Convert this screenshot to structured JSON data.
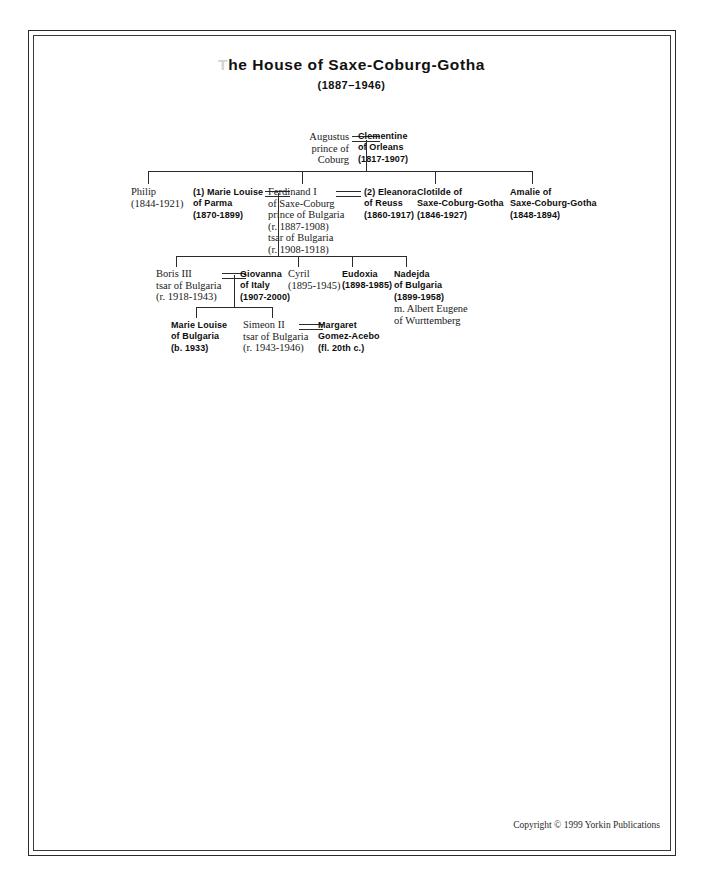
{
  "document": {
    "title_prefix": "T",
    "title_rest": "he House of Saxe-Coburg-Gotha",
    "subtitle": "(1887–1946)",
    "copyright": "Copyright © 1999 Yorkin Publications"
  },
  "generation1": {
    "augustus": {
      "line1": "Augustus",
      "line2": "prince of",
      "line3": "Coburg"
    },
    "clementine": {
      "line1": "Clementine",
      "line2": "of Orleans",
      "line3": "(1817-1907)"
    }
  },
  "generation2": {
    "philip": {
      "line1": "Philip",
      "line2": "(1844-1921)"
    },
    "marie_louise_parma": {
      "line1": "(1) Marie Louise",
      "line2": "of Parma",
      "line3": "(1870-1899)"
    },
    "ferdinand": {
      "line1": "Ferdinand I",
      "line2": "of Saxe-Coburg",
      "line3": "prince of Bulgaria",
      "line4": "(r. 1887-1908)",
      "line5": "tsar of Bulgaria",
      "line6": "(r. 1908-1918)"
    },
    "eleanora_reuss": {
      "line1": "(2) Eleanora",
      "line2": "of Reuss",
      "line3": "(1860-1917)"
    },
    "clotilde": {
      "line1": "Clotilde of",
      "line2": "Saxe-Coburg-Gotha",
      "line3": "(1846-1927)"
    },
    "amalie": {
      "line1": "Amalie of",
      "line2": "Saxe-Coburg-Gotha",
      "line3": "(1848-1894)"
    }
  },
  "generation3": {
    "boris": {
      "line1": "Boris III",
      "line2": "tsar of Bulgaria",
      "line3": "(r. 1918-1943)"
    },
    "giovanna": {
      "line1": "Giovanna",
      "line2": "of Italy",
      "line3": "(1907-2000)"
    },
    "cyril": {
      "line1": "Cyril",
      "line2": "(1895-1945)"
    },
    "eudoxia": {
      "line1": "Eudoxia",
      "line2": "(1898-1985)"
    },
    "nadejda": {
      "line1": "Nadejda",
      "line2": "of Bulgaria",
      "line3": "(1899-1958)",
      "line4": "m. Albert Eugene",
      "line5": "of Wurttemberg"
    }
  },
  "generation4": {
    "marie_louise_bulgaria": {
      "line1": "Marie Louise",
      "line2": "of Bulgaria",
      "line3": "(b. 1933)"
    },
    "simeon": {
      "line1": "Simeon II",
      "line2": "tsar of Bulgaria",
      "line3": "(r. 1943-1946)"
    },
    "margaret": {
      "line1": "Margaret",
      "line2": "Gomez-Acebo",
      "line3": "(fl. 20th c.)"
    }
  }
}
